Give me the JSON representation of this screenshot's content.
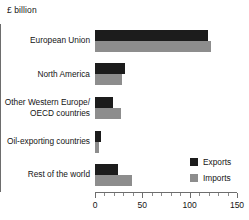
{
  "chart_data": {
    "type": "bar",
    "orientation": "horizontal",
    "title": "",
    "subtitle": "",
    "xlabel": "£ billion",
    "ylabel": "",
    "unit_label": "£ billion",
    "categories": [
      "European Union",
      "North America",
      "Other Western Europe/ OECD countries",
      "Oil-exporting countries",
      "Rest of the world"
    ],
    "category_lines": [
      [
        "European Union"
      ],
      [
        "North America"
      ],
      [
        "Other Western Europe/",
        "OECD countries"
      ],
      [
        "Oil-exporting countries"
      ],
      [
        "Rest of the world"
      ]
    ],
    "series": [
      {
        "name": "Exports",
        "color": "#1c1c1c",
        "values": [
          119,
          32,
          19,
          6,
          24
        ]
      },
      {
        "name": "Imports",
        "color": "#8d8d8d",
        "values": [
          123,
          28,
          27,
          4,
          39
        ]
      }
    ],
    "xlim": [
      0,
      150
    ],
    "xticks": [
      0,
      50,
      100,
      150
    ],
    "xtick_labels": [
      "0",
      "50",
      "100",
      "150"
    ],
    "xtick_minor_step": 10,
    "grid": false,
    "legend": {
      "position": "bottom-right",
      "entries": [
        {
          "label": "Exports",
          "color": "#1c1c1c"
        },
        {
          "label": "Imports",
          "color": "#8d8d8d"
        }
      ]
    }
  }
}
